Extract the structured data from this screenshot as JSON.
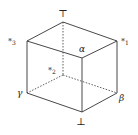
{
  "diagram": {
    "type": "lattice-cube",
    "stroke_color": "#333333",
    "background": "#ffffff",
    "vertices": {
      "top": {
        "label": "⊤",
        "x": 63,
        "y": 22
      },
      "star1": {
        "label": "*",
        "sub": "1",
        "x": 117,
        "y": 41
      },
      "star2": {
        "label": "*",
        "sub": "2",
        "x": 63,
        "y": 75
      },
      "star3": {
        "label": "*",
        "sub": "3",
        "x": 27,
        "y": 41
      },
      "alpha": {
        "label": "α",
        "x": 82,
        "y": 58
      },
      "beta": {
        "label": "β",
        "x": 117,
        "y": 93
      },
      "gamma": {
        "label": "γ",
        "x": 27,
        "y": 93
      },
      "bottom": {
        "label": "⊥",
        "x": 82,
        "y": 112
      }
    },
    "labels": {
      "top": "⊤",
      "bottom": "⊥",
      "alpha": "α",
      "beta": "β",
      "gamma": "γ",
      "star": "*",
      "sub1": "1",
      "sub2": "2",
      "sub3": "3"
    },
    "solid_edges": [
      [
        "top",
        "star3"
      ],
      [
        "top",
        "star1"
      ],
      [
        "star3",
        "alpha"
      ],
      [
        "star1",
        "alpha"
      ],
      [
        "star3",
        "gamma"
      ],
      [
        "star1",
        "beta"
      ],
      [
        "alpha",
        "bottom"
      ],
      [
        "gamma",
        "bottom"
      ],
      [
        "beta",
        "bottom"
      ]
    ],
    "dashed_edges": [
      [
        "top",
        "star2"
      ],
      [
        "star2",
        "gamma"
      ],
      [
        "star2",
        "beta"
      ]
    ]
  }
}
